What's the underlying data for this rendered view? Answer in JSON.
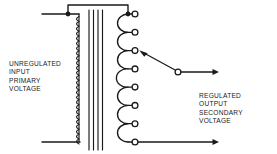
{
  "diagram": {
    "type": "schematic",
    "background_color": "#ffffff",
    "line_color": "#1a1a1a",
    "labels": {
      "primary": {
        "name": "unregulated-input-primary-voltage-label",
        "lines": [
          "UNREGULATED",
          "INPUT",
          "PRIMARY",
          "VOLTAGE"
        ]
      },
      "secondary": {
        "name": "regulated-output-secondary-voltage-label",
        "lines": [
          "REGULATED",
          "OUTPUT",
          "SECONDARY",
          "VOLTAGE"
        ]
      }
    },
    "components": {
      "primary_winding": {
        "name": "primary-coil",
        "turns": 26,
        "x": 79,
        "y_top": 14,
        "y_bottom": 142
      },
      "core": {
        "name": "transformer-core",
        "line_count": 4,
        "x_positions": [
          89,
          93.5,
          98,
          102.5
        ],
        "y_top": 10,
        "y_bottom": 150
      },
      "secondary_winding": {
        "name": "secondary-coil",
        "loop_count": 7,
        "x_tap_line": 128,
        "loop_height": 18.3,
        "y_top": 14,
        "y_bottom": 142
      },
      "taps": {
        "name": "secondary-tap-terminals",
        "count": 8,
        "x": 135,
        "radius": 3,
        "y_positions": [
          14,
          32.3,
          50.6,
          68.9,
          87.1,
          105.4,
          123.7,
          142
        ]
      },
      "junction_dots": {
        "name": "junction-dots",
        "radius": 2.3,
        "points": [
          [
            68,
            14
          ],
          [
            128,
            14
          ]
        ]
      },
      "jumper": {
        "name": "primary-secondary-jumper-wire",
        "path": [
          [
            68,
            14
          ],
          [
            68,
            5
          ],
          [
            128,
            5
          ],
          [
            128,
            14
          ]
        ]
      },
      "input_leads": {
        "name": "input-lead-wires",
        "top": [
          [
            42,
            14
          ],
          [
            79,
            14
          ]
        ],
        "bottom": [
          [
            42,
            142
          ],
          [
            79,
            142
          ]
        ]
      },
      "wiper": {
        "name": "adjustable-tap-wiper",
        "pivot": [
          178,
          72
        ],
        "pivot_radius": 3,
        "arrow_tip": [
          140,
          51
        ],
        "selected_tap_index": 2
      },
      "output_leads": {
        "name": "output-lead-wires",
        "top": [
          [
            181,
            72
          ],
          [
            218,
            72
          ]
        ],
        "bottom": [
          [
            135,
            142
          ],
          [
            218,
            142
          ]
        ]
      }
    }
  }
}
